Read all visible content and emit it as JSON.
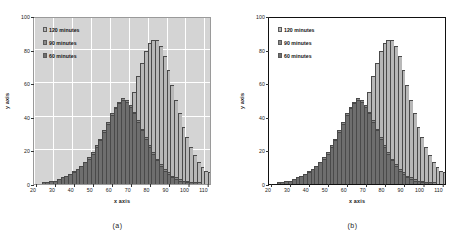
{
  "figure": {
    "panels": [
      {
        "id": "a",
        "caption": "(a)",
        "background": "#d4d4d4",
        "gridlines": true,
        "frame_color": "#9a9a9a"
      },
      {
        "id": "b",
        "caption": "(b)",
        "background": "#ffffff",
        "gridlines": false,
        "frame_color": "#111111"
      }
    ]
  },
  "axes": {
    "xlabel": "x axis",
    "ylabel": "y axis",
    "xticks": [
      20,
      30,
      40,
      50,
      60,
      70,
      80,
      90,
      100,
      110
    ],
    "yticks": [
      0,
      20,
      40,
      60,
      80,
      100
    ],
    "xlim": [
      20,
      114
    ],
    "ylim": [
      0,
      100
    ]
  },
  "legend": {
    "position": "top-left",
    "items": [
      {
        "label": "120 minutes",
        "color": "#b8b8b8"
      },
      {
        "label": "90 minutes",
        "color": "#8a8a8a"
      },
      {
        "label": "60 minutes",
        "color": "#6e6e6e"
      }
    ]
  },
  "chart_data": {
    "type": "bar",
    "title": "",
    "xlabel": "x axis",
    "ylabel": "y axis",
    "xlim": [
      20,
      114
    ],
    "ylim": [
      0,
      100
    ],
    "grid": "panel-a-only",
    "bin_width": 2,
    "x": [
      21,
      23,
      25,
      27,
      29,
      31,
      33,
      35,
      37,
      39,
      41,
      43,
      45,
      47,
      49,
      51,
      53,
      55,
      57,
      59,
      61,
      63,
      65,
      67,
      69,
      71,
      73,
      75,
      77,
      79,
      81,
      83,
      85,
      87,
      89,
      91,
      93,
      95,
      97,
      99,
      101,
      103,
      105,
      107,
      109,
      111,
      113
    ],
    "series": [
      {
        "name": "120 minutes",
        "color": "#b8b8b8",
        "values": [
          0,
          0,
          0,
          1,
          1,
          1,
          2,
          2,
          3,
          3,
          4,
          4,
          5,
          5,
          6,
          7,
          8,
          9,
          11,
          13,
          16,
          20,
          25,
          31,
          38,
          46,
          55,
          64,
          72,
          79,
          84,
          86,
          86,
          82,
          76,
          68,
          59,
          50,
          42,
          34,
          28,
          22,
          17,
          13,
          10,
          8,
          7
        ]
      },
      {
        "name": "90 minutes",
        "color": "#8a8a8a",
        "values": [
          0,
          0,
          1,
          1,
          2,
          2,
          3,
          4,
          5,
          6,
          8,
          9,
          11,
          13,
          16,
          19,
          23,
          27,
          32,
          37,
          42,
          46,
          49,
          51,
          50,
          47,
          43,
          38,
          33,
          28,
          23,
          19,
          15,
          12,
          9,
          7,
          5,
          4,
          3,
          2,
          2,
          1,
          1,
          1,
          0,
          0,
          0
        ]
      },
      {
        "name": "60 minutes",
        "color": "#6e6e6e",
        "values": [
          0,
          0,
          1,
          1,
          2,
          2,
          3,
          4,
          5,
          6,
          7,
          9,
          11,
          13,
          15,
          18,
          22,
          26,
          31,
          36,
          41,
          45,
          48,
          50,
          49,
          46,
          42,
          37,
          32,
          27,
          22,
          18,
          14,
          11,
          8,
          6,
          4,
          3,
          2,
          2,
          1,
          1,
          1,
          0,
          0,
          0,
          0
        ]
      }
    ]
  }
}
